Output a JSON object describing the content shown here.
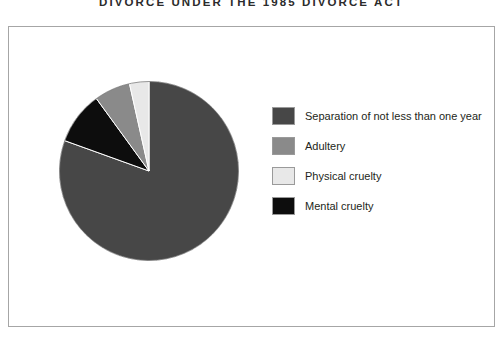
{
  "title": "DIVORCE UNDER THE 1985 DIVORCE ACT",
  "frame": {
    "border_color": "#a6a6a6",
    "background": "#ffffff"
  },
  "legend": {
    "position": "right",
    "items": [
      {
        "label": "Separation of not less than one year",
        "color": "#474747"
      },
      {
        "label": "Adultery",
        "color": "#8a8a8a"
      },
      {
        "label": "Physical cruelty",
        "color": "#e8e8e8"
      },
      {
        "label": "Mental cruelty",
        "color": "#0d0d0d"
      }
    ]
  },
  "chart_data": {
    "type": "pie",
    "title": "DIVORCE UNDER THE 1985 DIVORCE ACT",
    "xlabel": "",
    "ylabel": "",
    "legend_position": "right",
    "grid": false,
    "start_angle_deg": 0,
    "direction": "clockwise",
    "categories": [
      "Separation of not less than one year",
      "Adultery",
      "Physical cruelty",
      "Mental cruelty"
    ],
    "values": [
      80.5,
      6.5,
      3.5,
      9.5
    ],
    "units": "percent",
    "colors": [
      "#474747",
      "#8a8a8a",
      "#e8e8e8",
      "#0d0d0d"
    ],
    "slices": [
      {
        "label": "Separation of not less than one year",
        "value": 80.5,
        "color": "#474747",
        "start_deg": 0,
        "end_deg": 289.8
      },
      {
        "label": "Mental cruelty",
        "value": 9.5,
        "color": "#0d0d0d",
        "start_deg": 289.8,
        "end_deg": 324.0
      },
      {
        "label": "Adultery",
        "value": 6.5,
        "color": "#8a8a8a",
        "start_deg": 324.0,
        "end_deg": 347.4
      },
      {
        "label": "Physical cruelty",
        "value": 3.5,
        "color": "#e8e8e8",
        "start_deg": 347.4,
        "end_deg": 360.0
      }
    ]
  }
}
